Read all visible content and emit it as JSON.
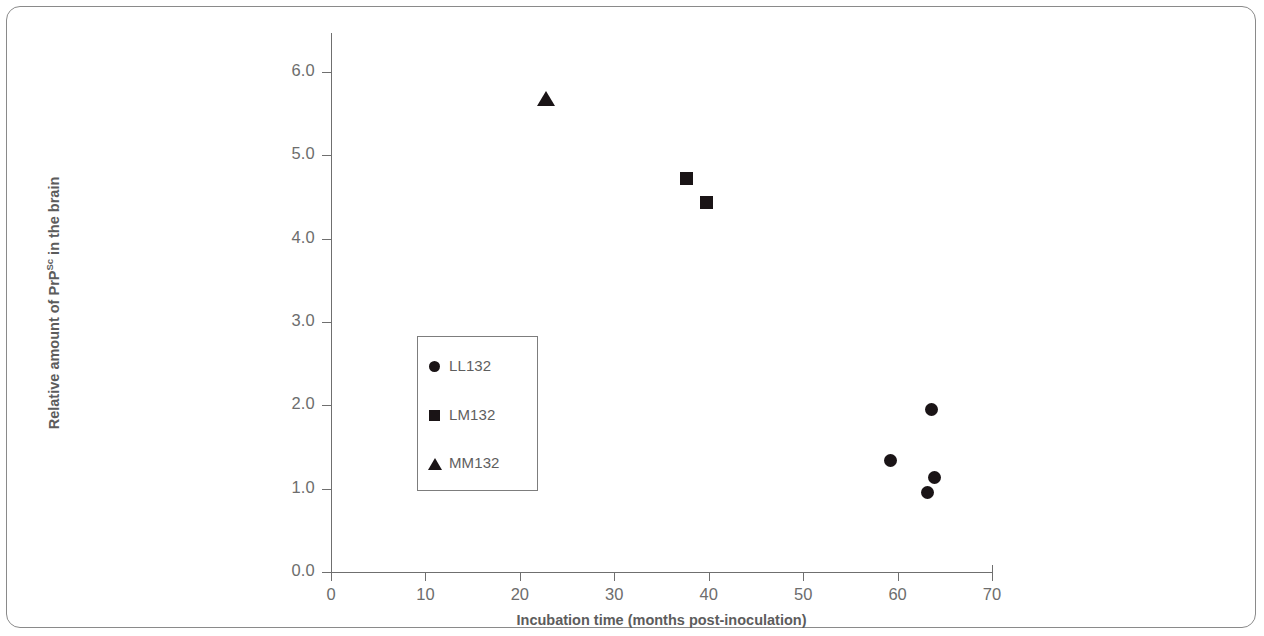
{
  "chart_data": {
    "type": "scatter",
    "title": "",
    "xlabel": "Incubation time (months post-inoculation)",
    "ylabel": "Relative amount of PrPSc in the brain",
    "ylabel_base": "Relative amount of PrP",
    "ylabel_sup": "Sc",
    "ylabel_tail": " in the brain",
    "xlim": [
      0,
      70
    ],
    "ylim": [
      0.0,
      6.0
    ],
    "xticks": [
      0,
      10,
      20,
      30,
      40,
      50,
      60,
      70
    ],
    "xtick_labels": [
      "0",
      "10",
      "20",
      "30",
      "40",
      "50",
      "60",
      "70"
    ],
    "yticks": [
      0.0,
      1.0,
      2.0,
      3.0,
      4.0,
      5.0,
      6.0
    ],
    "ytick_labels": [
      "0.0",
      "1.0",
      "2.0",
      "3.0",
      "4.0",
      "5.0",
      "6.0"
    ],
    "grid": false,
    "legend_position": "center-left inside plot",
    "marker_color": "#1a1416",
    "axis_color": "#6f6f6f",
    "series": [
      {
        "name": "LL132",
        "marker": "circle",
        "points": [
          {
            "x": 59.3,
            "y": 1.34
          },
          {
            "x": 63.6,
            "y": 1.95
          },
          {
            "x": 63.9,
            "y": 1.13
          },
          {
            "x": 63.2,
            "y": 0.96
          }
        ]
      },
      {
        "name": "LM132",
        "marker": "square",
        "points": [
          {
            "x": 37.7,
            "y": 4.72
          },
          {
            "x": 39.8,
            "y": 4.43
          }
        ]
      },
      {
        "name": "MM132",
        "marker": "triangle",
        "points": [
          {
            "x": 22.8,
            "y": 5.67
          }
        ]
      }
    ],
    "legend": [
      {
        "label": "LL132",
        "marker": "circle"
      },
      {
        "label": "LM132",
        "marker": "square"
      },
      {
        "label": "MM132",
        "marker": "triangle"
      }
    ]
  }
}
